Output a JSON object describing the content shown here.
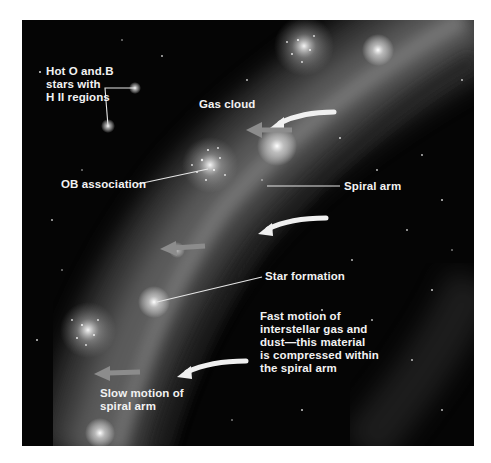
{
  "figure": {
    "background_color": "#050505",
    "arm_color": "#8a8a8a",
    "fast_arrow_color": "#f0f0f0",
    "slow_arrow_color": "#8c8c8c",
    "leader_line_color": "#e6e6e6"
  },
  "labels": {
    "hot_ob_stars": "Hot O and.B\nstars with\nH II regions",
    "gas_cloud": "Gas cloud",
    "ob_association": "OB association",
    "spiral_arm": "Spiral arm",
    "star_formation": "Star formation",
    "fast_motion": "Fast motion of\ninterstellar gas and\ndust—this material\nis compressed within\nthe spiral arm",
    "slow_motion": "Slow motion of\nspiral arm"
  },
  "arrows": {
    "fast_motion_count": 3,
    "slow_motion_count": 3
  }
}
